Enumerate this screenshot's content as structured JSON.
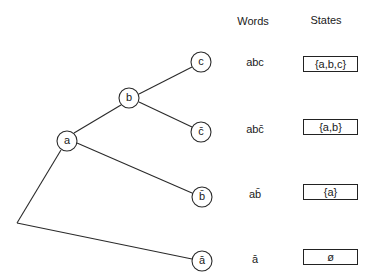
{
  "headers": {
    "words": "Words",
    "states": "States"
  },
  "nodes": {
    "a": "a",
    "b": "b",
    "c": "c",
    "c_bar": "c̄",
    "b_bar": "b̄",
    "a_bar": "ā"
  },
  "rows": [
    {
      "word": "abc",
      "state": "{a,b,c}"
    },
    {
      "word": "abc̄",
      "state": "{a,b}"
    },
    {
      "word": "ab̄",
      "state": "{a}"
    },
    {
      "word": "ā",
      "state": "ø"
    }
  ],
  "colors": {
    "line": "#2a2a2a",
    "background": "#ffffff"
  }
}
